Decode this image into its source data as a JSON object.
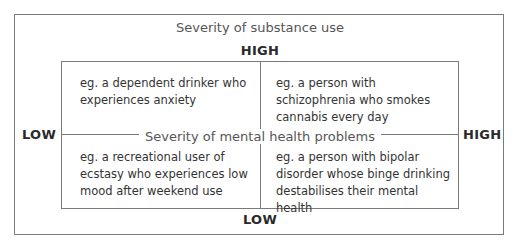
{
  "diagram": {
    "vertical_axis": {
      "title": "Severity of substance use",
      "high_label": "HIGH",
      "low_label": "LOW"
    },
    "horizontal_axis": {
      "title": "Severity of mental health problems",
      "low_label": "LOW",
      "high_label": "HIGH"
    },
    "quadrants": {
      "top_left": "eg. a dependent drinker who experiences anxiety",
      "top_right": "eg. a person with schizophrenia who smokes cannabis every day",
      "bottom_left": "eg. a recreational user of ecstasy who experiences low mood after weekend use",
      "bottom_right": "eg. a person with bipolar disorder whose binge drinking destabilises their mental health"
    },
    "colors": {
      "line": "#7a7a7a",
      "text": "#333333",
      "background": "#ffffff"
    }
  }
}
